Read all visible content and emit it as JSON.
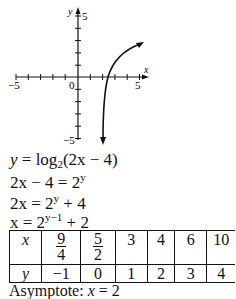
{
  "graph": {
    "x_axis_label": "x",
    "y_axis_label": "y",
    "x_min_label": "−5",
    "x_max_label": "5",
    "y_max_label": "5",
    "y_min_label": "−5",
    "origin_label": "0"
  },
  "steps": [
    {
      "id": "step1",
      "parts": [
        "y = log",
        "2",
        "(2",
        "x",
        " − 4)"
      ]
    },
    {
      "id": "step2"
    },
    {
      "id": "step3"
    },
    {
      "id": "step4"
    }
  ],
  "equations": {
    "line1_lhs": "y",
    "line1_rhs_func": "log",
    "line1_base": "2",
    "line1_arg": "(2x − 4)",
    "line2_lhs": "2x − 4 = 2",
    "line2_exp": "y",
    "line3_lhs": "2x = 2",
    "line3_exp": "y",
    "line3_tail": " + 4",
    "line4_lhs": "x = 2",
    "line4_exp": "y−1",
    "line4_tail": " + 2"
  },
  "table": {
    "x_header": "x",
    "y_header": "y",
    "x_values": [
      {
        "num": "9",
        "den": "4"
      },
      {
        "num": "5",
        "den": "2"
      },
      {
        "value": "3"
      },
      {
        "value": "4"
      },
      {
        "value": "6"
      },
      {
        "value": "10"
      }
    ],
    "y_values": [
      "−1",
      "0",
      "1",
      "2",
      "3",
      "4"
    ]
  },
  "asymptote": {
    "label": "Asymptote: ",
    "var": "x",
    "rest": " = 2"
  }
}
